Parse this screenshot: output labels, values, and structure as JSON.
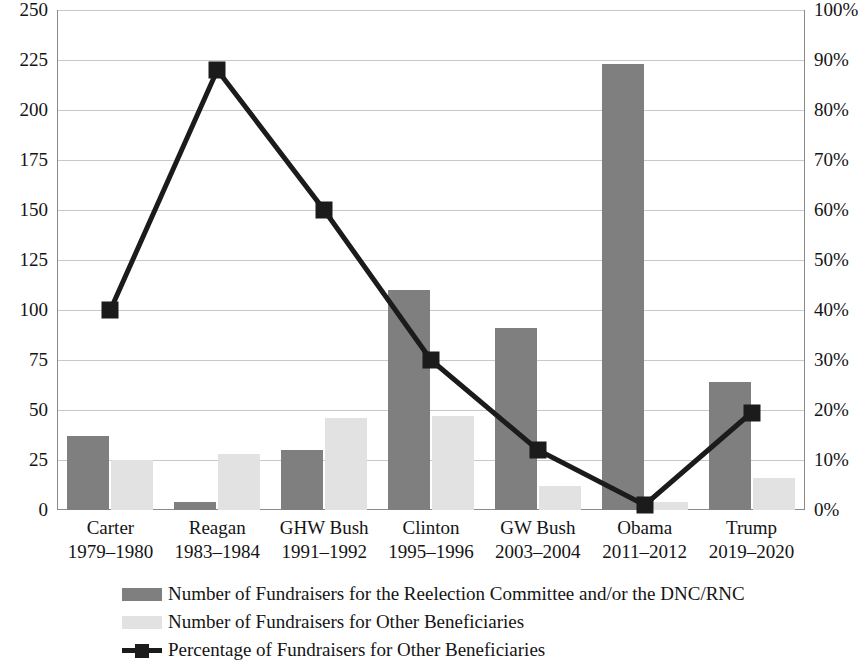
{
  "chart_data": {
    "type": "bar",
    "title": "",
    "subtitle": "",
    "xlabel": "",
    "ylabel": "",
    "y2label": "",
    "grid": true,
    "legend_position": "bottom",
    "categories": [
      "Carter\n1979–1980",
      "Reagan\n1983–1984",
      "GHW Bush\n1991–1992",
      "Clinton\n1995–1996",
      "GW Bush\n2003–2004",
      "Obama\n2011–2012",
      "Trump\n2019–2020"
    ],
    "category_names": [
      "Carter",
      "Reagan",
      "GHW Bush",
      "Clinton",
      "GW Bush",
      "Obama",
      "Trump"
    ],
    "category_years": [
      "1979–1980",
      "1983–1984",
      "1991–1992",
      "1995–1996",
      "2003–2004",
      "2011–2012",
      "2019–2020"
    ],
    "ylim": [
      0,
      250
    ],
    "y2lim": [
      0,
      100
    ],
    "yticks": [
      0,
      25,
      50,
      75,
      100,
      125,
      150,
      175,
      200,
      225,
      250
    ],
    "ytick_labels": [
      "0",
      "25",
      "50",
      "75",
      "100",
      "125",
      "150",
      "175",
      "200",
      "225",
      "250"
    ],
    "y2ticks": [
      0,
      10,
      20,
      30,
      40,
      50,
      60,
      70,
      80,
      90,
      100
    ],
    "y2tick_labels": [
      "0%",
      "10%",
      "20%",
      "30%",
      "40%",
      "50%",
      "60%",
      "70%",
      "80%",
      "90%",
      "100%"
    ],
    "series": [
      {
        "name": "Number of Fundraisers for the Reelection Committee and/or the DNC/RNC",
        "type": "bar",
        "axis": "left",
        "color": "#7f7f7f",
        "values": [
          37,
          4,
          30,
          110,
          91,
          223,
          64
        ]
      },
      {
        "name": "Number of Fundraisers for Other Beneficiaries",
        "type": "bar",
        "axis": "left",
        "color": "#e2e2e2",
        "values": [
          25,
          28,
          46,
          47,
          12,
          4,
          16
        ]
      },
      {
        "name": "Percentage of Fundraisers for Other Beneficiaries",
        "type": "line",
        "axis": "right",
        "color": "#1b1b1b",
        "values": [
          40,
          88,
          60,
          30,
          12,
          1,
          19.5
        ]
      }
    ]
  },
  "axes": {
    "left_ticks": [
      "250",
      "225",
      "200",
      "175",
      "150",
      "125",
      "100",
      "75",
      "50",
      "25",
      "0"
    ],
    "right_ticks": [
      "100%",
      "90%",
      "80%",
      "70%",
      "60%",
      "50%",
      "40%",
      "30%",
      "20%",
      "10%",
      "0%"
    ]
  },
  "legend": {
    "items": [
      {
        "label": "Number of Fundraisers for the Reelection Committee and/or the DNC/RNC",
        "swatch": "primary-bar-swatch"
      },
      {
        "label": "Number of Fundraisers for Other Beneficiaries",
        "swatch": "secondary-bar-swatch"
      },
      {
        "label": "Percentage of Fundraisers for Other Beneficiaries",
        "swatch": "line-marker-swatch"
      }
    ]
  },
  "colors": {
    "primary_bar": "#7f7f7f",
    "secondary_bar": "#e2e2e2",
    "line": "#1b1b1b",
    "gridline": "#c8c8c8",
    "axis": "#8a8a8a",
    "text": "#141414",
    "background": "#ffffff"
  }
}
